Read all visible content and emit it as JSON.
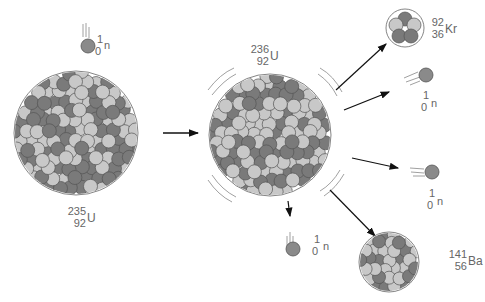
{
  "nuclei": {
    "u235": {
      "mass": "235",
      "z": "92",
      "symbol": "U"
    },
    "u236": {
      "mass": "236",
      "z": "92",
      "symbol": "U"
    },
    "kr92": {
      "mass": "92",
      "z": "36",
      "symbol": "Kr"
    },
    "ba141": {
      "mass": "141",
      "z": "56",
      "symbol": "Ba"
    }
  },
  "neutron": {
    "mass": "1",
    "z": "0",
    "symbol": "n"
  },
  "neutrons": [
    {
      "id": "incoming",
      "mass": "1",
      "z": "0",
      "symbol": "n"
    },
    {
      "id": "released-1",
      "mass": "1",
      "z": "0",
      "symbol": "n"
    },
    {
      "id": "released-2",
      "mass": "1",
      "z": "0",
      "symbol": "n"
    },
    {
      "id": "released-3",
      "mass": "1",
      "z": "0",
      "symbol": "n"
    }
  ],
  "colors": {
    "proton_dark": "#7a7a7a",
    "neutron_light": "#c8c8c8",
    "outline": "#555555",
    "arrow": "#111111",
    "text": "#666666"
  }
}
